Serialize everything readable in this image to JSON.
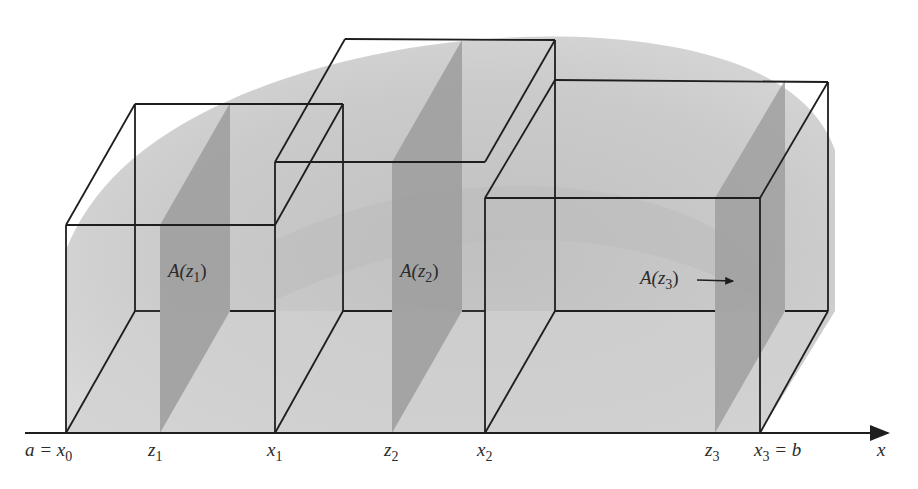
{
  "figure": {
    "axis": {
      "label": "x",
      "ticks": [
        {
          "id": "x0",
          "text": "a = x",
          "sub": "0",
          "x": 66
        },
        {
          "id": "z1",
          "text": "z",
          "sub": "1",
          "x": 160
        },
        {
          "id": "x1",
          "text": "x",
          "sub": "1",
          "x": 275
        },
        {
          "id": "z2",
          "text": "z",
          "sub": "2",
          "x": 392
        },
        {
          "id": "x2",
          "text": "x",
          "sub": "2",
          "x": 485
        },
        {
          "id": "z3",
          "text": "z",
          "sub": "3",
          "x": 715
        },
        {
          "id": "x3",
          "text": "x",
          "sub": "3",
          "suffix": " = b",
          "x": 760
        }
      ]
    },
    "cross_sections": [
      {
        "id": "A1",
        "text": "A(z",
        "sub": "1",
        "close": ")"
      },
      {
        "id": "A2",
        "text": "A(z",
        "sub": "2",
        "close": ")"
      },
      {
        "id": "A3",
        "text": "A(z",
        "sub": "3",
        "close": ")",
        "arrow": true
      }
    ],
    "colors": {
      "ink": "#1e1e1e",
      "solid_fill": "#c9c9c9",
      "solid_shadow": "#b3b3b3",
      "section_fill": "#9a9a9a",
      "background": "#ffffff"
    }
  }
}
